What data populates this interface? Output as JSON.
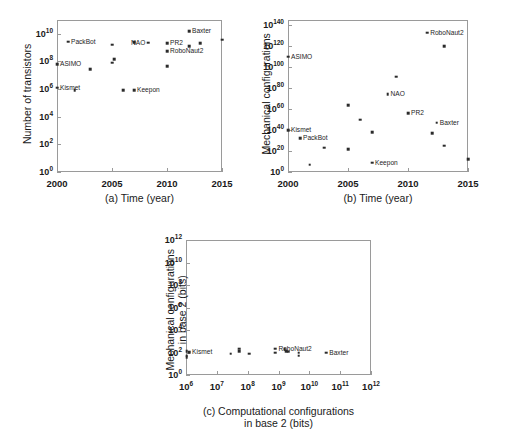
{
  "figure": {
    "background": "#ffffff",
    "marker_color": "#2b2b2b",
    "axis_color": "#9a9a9a"
  },
  "chart_data": [
    {
      "id": "panel-a",
      "type": "scatter",
      "title": "",
      "caption": "(a)  Time (year)",
      "xlabel": "(a)  Time (year)",
      "ylabel": "Number of transistors",
      "xscale": "linear",
      "yscale": "log",
      "xlim": [
        2000,
        2015
      ],
      "ylim": [
        1,
        100000000000.0
      ],
      "xticks": [
        "2000",
        "2005",
        "2010",
        "2015"
      ],
      "xtick_values": [
        2000,
        2005,
        2010,
        2015
      ],
      "yticks": [
        "10^0",
        "10^2",
        "10^4",
        "10^6",
        "10^8",
        "10^10"
      ],
      "ytick_exponents": [
        0,
        2,
        4,
        6,
        8,
        10
      ],
      "grid": false,
      "legend": "none",
      "points": [
        {
          "label": "Kismet",
          "label_pos": "right",
          "x": 2000.0,
          "y": 1300000.0
        },
        {
          "label": "ASIMO",
          "label_pos": "right",
          "x": 2000.0,
          "y": 65000000.0
        },
        {
          "label": "PackBot",
          "label_pos": "right",
          "x": 2001.0,
          "y": 2600000000.0
        },
        {
          "label": "",
          "label_pos": "right",
          "x": 2001.6,
          "y": 800000.0
        },
        {
          "label": "",
          "label_pos": "right",
          "x": 2003.0,
          "y": 28000000.0
        },
        {
          "label": "",
          "label_pos": "right",
          "x": 2005.0,
          "y": 1600000000.0
        },
        {
          "label": "",
          "label_pos": "right",
          "x": 2005.0,
          "y": 80000000.0
        },
        {
          "label": "",
          "label_pos": "right",
          "x": 2005.2,
          "y": 150000000.0
        },
        {
          "label": "",
          "label_pos": "right",
          "x": 2006.0,
          "y": 800000.0
        },
        {
          "label": "Keepon",
          "label_pos": "right",
          "x": 2007.0,
          "y": 850000.0
        },
        {
          "label": "",
          "label_pos": "right",
          "x": 2007.0,
          "y": 2400000000.0
        },
        {
          "label": "NAO",
          "label_pos": "both",
          "x": 2008.3,
          "y": 2200000000.0
        },
        {
          "label": "PR2",
          "label_pos": "right",
          "x": 2010.0,
          "y": 2000000000.0
        },
        {
          "label": "RoboNaut2",
          "label_pos": "right",
          "x": 2010.0,
          "y": 550000000.0
        },
        {
          "label": "",
          "label_pos": "right",
          "x": 2010.0,
          "y": 45000000.0
        },
        {
          "label": "Baxter",
          "label_pos": "right",
          "x": 2012.0,
          "y": 15000000000.0
        },
        {
          "label": "",
          "label_pos": "right",
          "x": 2012.0,
          "y": 1300000000.0
        },
        {
          "label": "",
          "label_pos": "right",
          "x": 2013.0,
          "y": 2100000000.0
        },
        {
          "label": "",
          "label_pos": "right",
          "x": 2015.0,
          "y": 3800000000.0
        }
      ]
    },
    {
      "id": "panel-b",
      "type": "scatter",
      "title": "",
      "caption": "(b)  Time (year)",
      "xlabel": "(b)  Time (year)",
      "ylabel": "Mechanical configurations",
      "xscale": "linear",
      "yscale": "log",
      "xlim": [
        2000,
        2015
      ],
      "ylim": [
        1,
        1e+145
      ],
      "xticks": [
        "2000",
        "2005",
        "2010",
        "2015"
      ],
      "xtick_values": [
        2000,
        2005,
        2010,
        2015
      ],
      "yticks": [
        "10^0",
        "10^20",
        "10^40",
        "10^60",
        "10^80",
        "10^100",
        "10^120",
        "10^140"
      ],
      "ytick_exponents": [
        0,
        20,
        40,
        60,
        80,
        100,
        120,
        140
      ],
      "grid": false,
      "legend": "none",
      "points": [
        {
          "label": "Kismet",
          "label_pos": "right",
          "x": 2000.0,
          "y_exp": 40
        },
        {
          "label": "ASIMO",
          "label_pos": "right",
          "x": 2000.0,
          "y_exp": 110
        },
        {
          "label": "PackBot",
          "label_pos": "right",
          "x": 2001.0,
          "y_exp": 32
        },
        {
          "label": "",
          "label_pos": "right",
          "x": 2001.8,
          "y_exp": 7
        },
        {
          "label": "",
          "label_pos": "right",
          "x": 2003.0,
          "y_exp": 23
        },
        {
          "label": "",
          "label_pos": "right",
          "x": 2005.0,
          "y_exp": 64
        },
        {
          "label": "",
          "label_pos": "right",
          "x": 2005.0,
          "y_exp": 22
        },
        {
          "label": "",
          "label_pos": "right",
          "x": 2006.0,
          "y_exp": 50
        },
        {
          "label": "",
          "label_pos": "right",
          "x": 2007.0,
          "y_exp": 38
        },
        {
          "label": "Keepon",
          "label_pos": "right",
          "x": 2007.0,
          "y_exp": 9
        },
        {
          "label": "NAO",
          "label_pos": "right",
          "x": 2008.3,
          "y_exp": 74
        },
        {
          "label": "",
          "label_pos": "right",
          "x": 2009.0,
          "y_exp": 91
        },
        {
          "label": "RoboNaut2",
          "label_pos": "right",
          "x": 2011.6,
          "y_exp": 133
        },
        {
          "label": "PR2",
          "label_pos": "right",
          "x": 2010.0,
          "y_exp": 56
        },
        {
          "label": "",
          "label_pos": "right",
          "x": 2012.0,
          "y_exp": 37
        },
        {
          "label": "Baxter",
          "label_pos": "right",
          "x": 2012.4,
          "y_exp": 47
        },
        {
          "label": "",
          "label_pos": "right",
          "x": 2013.0,
          "y_exp": 120
        },
        {
          "label": "",
          "label_pos": "right",
          "x": 2013.0,
          "y_exp": 25
        },
        {
          "label": "",
          "label_pos": "right",
          "x": 2015.0,
          "y_exp": 12
        }
      ]
    },
    {
      "id": "panel-c",
      "type": "scatter",
      "title": "",
      "caption": "(c)  Computational configurations in base 2 (bits)",
      "xlabel_line1": "(c)  Computational configurations",
      "xlabel_line2": "in base 2 (bits)",
      "ylabel_line1": "Mechanical configurations",
      "ylabel_line2": "in base 2 (bits)",
      "xscale": "log",
      "yscale": "log",
      "xlim": [
        1000000.0,
        1000000000000.0
      ],
      "ylim": [
        1,
        1000000000000.0
      ],
      "xticks": [
        "10^6",
        "10^7",
        "10^8",
        "10^9",
        "10^10",
        "10^11",
        "10^12"
      ],
      "xtick_exponents": [
        6,
        7,
        8,
        9,
        10,
        11,
        12
      ],
      "yticks": [
        "10^0",
        "10^2",
        "10^4",
        "10^6",
        "10^8",
        "10^10",
        "10^12"
      ],
      "ytick_exponents": [
        0,
        2,
        4,
        6,
        8,
        10,
        12
      ],
      "grid": false,
      "legend": "none",
      "points": [
        {
          "label": "",
          "label_pos": "right",
          "x_exp": 6.02,
          "y_exp": 2.1
        },
        {
          "label": "",
          "label_pos": "right",
          "x_exp": 6.02,
          "y_exp": 1.72
        },
        {
          "label": "",
          "label_pos": "right",
          "x_exp": 6.02,
          "y_exp": 1.58
        },
        {
          "label": "Kismet",
          "label_pos": "right",
          "x_exp": 6.1,
          "y_exp": 2.02
        },
        {
          "label": "",
          "label_pos": "right",
          "x_exp": 7.45,
          "y_exp": 1.9
        },
        {
          "label": "",
          "label_pos": "right",
          "x_exp": 7.72,
          "y_exp": 2.32
        },
        {
          "label": "",
          "label_pos": "right",
          "x_exp": 7.72,
          "y_exp": 2.12
        },
        {
          "label": "",
          "label_pos": "right",
          "x_exp": 8.05,
          "y_exp": 1.9
        },
        {
          "label": "RoboNaut2",
          "label_pos": "right",
          "x_exp": 8.9,
          "y_exp": 2.34
        },
        {
          "label": "",
          "label_pos": "right",
          "x_exp": 8.9,
          "y_exp": 2.0
        },
        {
          "label": "",
          "label_pos": "right",
          "x_exp": 9.2,
          "y_exp": 2.3
        },
        {
          "label": "",
          "label_pos": "right",
          "x_exp": 9.25,
          "y_exp": 2.12
        },
        {
          "label": "",
          "label_pos": "right",
          "x_exp": 9.32,
          "y_exp": 2.08
        },
        {
          "label": "",
          "label_pos": "right",
          "x_exp": 9.65,
          "y_exp": 2.0
        },
        {
          "label": "",
          "label_pos": "right",
          "x_exp": 9.65,
          "y_exp": 1.72
        },
        {
          "label": "Baxter",
          "label_pos": "right",
          "x_exp": 10.55,
          "y_exp": 2.0
        }
      ]
    }
  ]
}
